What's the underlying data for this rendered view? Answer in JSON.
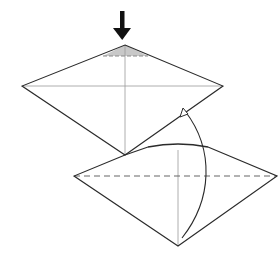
{
  "diagram": {
    "type": "origami-fold-instruction",
    "colors": {
      "outline": "#2b2b2b",
      "crease": "#9a9a9a",
      "shade": "#c8c8c8",
      "valley_fold": "#666666",
      "arrow": "#111111"
    },
    "steps": [
      {
        "name": "before",
        "description": "Kite/diamond shape with vertical and horizontal creases; top tip shaded with a small dashed fold line; push-down arrow above top tip"
      },
      {
        "name": "after",
        "description": "Flattened diamond with horizontal valley fold (dashed) and raised top flap; curved arrow indicating folding the bottom point up"
      }
    ]
  }
}
